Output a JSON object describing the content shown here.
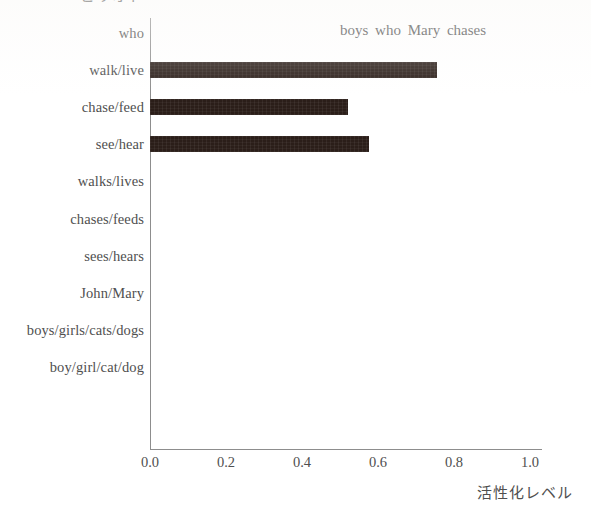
{
  "chart_data": {
    "type": "bar",
    "orientation": "horizontal",
    "title": "boys who Mary chases",
    "xlabel": "活性化レベル",
    "ylabel": "ピリオド",
    "xlim": [
      0.0,
      1.15
    ],
    "xticks": [
      "0.0",
      "0.2",
      "0.4",
      "0.6",
      "0.8",
      "1.0"
    ],
    "xtick_values": [
      0.0,
      0.2,
      0.4,
      0.6,
      0.8,
      1.0
    ],
    "grid": false,
    "legend": "none",
    "bar_color": "#2b1e19",
    "axis_color": "#8d8d8d",
    "categories": [
      "who",
      "walk/live",
      "chase/feed",
      "see/hear",
      "walks/lives",
      "chases/feeds",
      "sees/hears",
      "John/Mary",
      "boys/girls/cats/dogs",
      "boy/girl/cat/dog"
    ],
    "values": [
      0.0,
      0.755,
      0.52,
      0.575,
      0.0,
      0.0,
      0.0,
      0.0,
      0.0,
      0.0
    ]
  },
  "caption_remnant": ""
}
